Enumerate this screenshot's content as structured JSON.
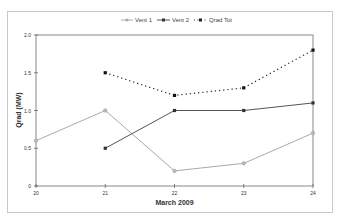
{
  "chart_data": {
    "type": "line",
    "title": "",
    "xlabel": "March 2009",
    "ylabel": "Qrad (MW)",
    "x": [
      20,
      21,
      22,
      23,
      24
    ],
    "categories": [
      "20",
      "21",
      "22",
      "23",
      "24"
    ],
    "ylim": [
      0,
      2.0
    ],
    "yticks": [
      "0",
      "0.5",
      "1.0",
      "1.5",
      "2.0"
    ],
    "grid": false,
    "legend_position": "top",
    "series": [
      {
        "name": "Vent 1",
        "values": [
          0.6,
          1.0,
          0.2,
          0.3,
          0.7
        ],
        "color": "#aaaaaa",
        "style": "solid",
        "marker": "circle"
      },
      {
        "name": "Vent 2",
        "values": [
          null,
          0.5,
          1.0,
          1.0,
          1.1
        ],
        "color": "#555555",
        "style": "solid",
        "marker": "square"
      },
      {
        "name": "Qrad Tot",
        "values": [
          null,
          1.5,
          1.2,
          1.3,
          1.8
        ],
        "color": "#222222",
        "style": "dotted",
        "marker": "square"
      }
    ]
  },
  "legend": {
    "items": [
      {
        "label": "Vent 1"
      },
      {
        "label": "Vent 2"
      },
      {
        "label": "Qrad Tot"
      }
    ]
  },
  "axes": {
    "x_title": "March 2009",
    "y_title": "Qrad (MW)",
    "x_ticks": [
      "20",
      "21",
      "22",
      "23",
      "24"
    ],
    "y_ticks": [
      "0",
      "0.5",
      "1.0",
      "1.5",
      "2.0"
    ]
  }
}
